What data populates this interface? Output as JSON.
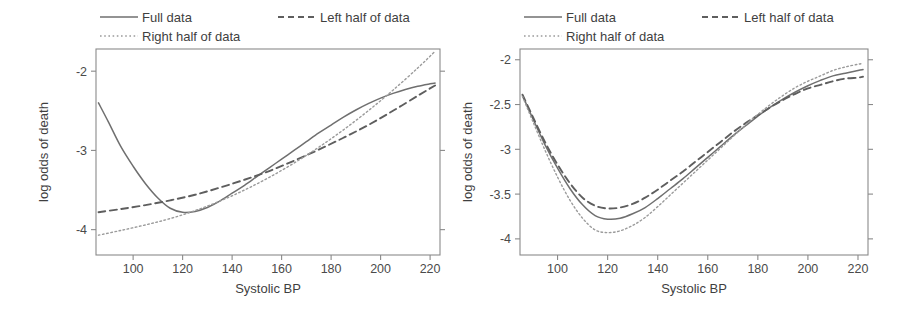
{
  "figure": {
    "title": "",
    "panel_count": 2
  },
  "legend": {
    "position": "top",
    "entries": [
      {
        "label": "Full data",
        "style": "solid",
        "color": "#6f6f6f"
      },
      {
        "label": "Left half of data",
        "style": "dashed",
        "color": "#5e5e5e"
      },
      {
        "label": "Right half of data",
        "style": "dotted",
        "color": "#9b9b9b"
      }
    ]
  },
  "chart_data": [
    {
      "type": "line",
      "panel": "left",
      "title": "",
      "xlabel": "Systolic BP",
      "ylabel": "log odds of death",
      "xlim": [
        85,
        224
      ],
      "ylim": [
        -4.32,
        -1.72
      ],
      "xticks": [
        100,
        120,
        140,
        160,
        180,
        200,
        220
      ],
      "xtick_labels": [
        "100",
        "120",
        "140",
        "160",
        "180",
        "200",
        "220"
      ],
      "yticks": [
        -2,
        -3,
        -4
      ],
      "ytick_labels": [
        "-2",
        "-3",
        "-4"
      ],
      "grid": false,
      "series": [
        {
          "name": "Full data",
          "style": "solid",
          "color": "#6f6f6f",
          "x": [
            86,
            90,
            95,
            100,
            105,
            110,
            115,
            120,
            125,
            130,
            135,
            140,
            145,
            150,
            155,
            160,
            165,
            170,
            175,
            180,
            185,
            190,
            195,
            200,
            205,
            210,
            215,
            220,
            222
          ],
          "y": [
            -2.4,
            -2.64,
            -2.95,
            -3.2,
            -3.42,
            -3.6,
            -3.73,
            -3.78,
            -3.77,
            -3.72,
            -3.64,
            -3.54,
            -3.44,
            -3.33,
            -3.22,
            -3.11,
            -3.0,
            -2.89,
            -2.78,
            -2.68,
            -2.58,
            -2.49,
            -2.41,
            -2.34,
            -2.28,
            -2.23,
            -2.19,
            -2.16,
            -2.15
          ]
        },
        {
          "name": "Left half of data",
          "style": "dashed",
          "color": "#5e5e5e",
          "x": [
            86,
            95,
            105,
            115,
            125,
            135,
            145,
            155,
            165,
            175,
            185,
            195,
            205,
            215,
            222
          ],
          "y": [
            -3.78,
            -3.74,
            -3.69,
            -3.63,
            -3.56,
            -3.47,
            -3.37,
            -3.26,
            -3.13,
            -2.99,
            -2.84,
            -2.68,
            -2.5,
            -2.31,
            -2.18
          ]
        },
        {
          "name": "Right half of data",
          "style": "dotted",
          "color": "#9b9b9b",
          "x": [
            86,
            95,
            105,
            115,
            125,
            135,
            145,
            155,
            165,
            175,
            185,
            195,
            205,
            215,
            222
          ],
          "y": [
            -4.07,
            -4.01,
            -3.94,
            -3.86,
            -3.76,
            -3.64,
            -3.5,
            -3.34,
            -3.16,
            -2.96,
            -2.74,
            -2.5,
            -2.24,
            -1.96,
            -1.75
          ]
        }
      ]
    },
    {
      "type": "line",
      "panel": "right",
      "title": "",
      "xlabel": "Systolic BP",
      "ylabel": "log odds of death",
      "xlim": [
        85,
        224
      ],
      "ylim": [
        -4.18,
        -1.88
      ],
      "xticks": [
        100,
        120,
        140,
        160,
        180,
        200,
        220
      ],
      "xtick_labels": [
        "100",
        "120",
        "140",
        "160",
        "180",
        "200",
        "220"
      ],
      "yticks": [
        -2,
        -2.5,
        -3,
        -3.5,
        -4
      ],
      "ytick_labels": [
        "-2",
        "-2.5",
        "-3",
        "-3.5",
        "-4"
      ],
      "grid": false,
      "series": [
        {
          "name": "Full data",
          "style": "solid",
          "color": "#6f6f6f",
          "x": [
            86,
            90,
            95,
            100,
            105,
            110,
            115,
            120,
            125,
            130,
            135,
            140,
            145,
            150,
            155,
            160,
            165,
            170,
            175,
            180,
            185,
            190,
            195,
            200,
            205,
            210,
            215,
            220,
            222
          ],
          "y": [
            -2.4,
            -2.65,
            -2.95,
            -3.21,
            -3.44,
            -3.62,
            -3.74,
            -3.78,
            -3.77,
            -3.72,
            -3.65,
            -3.55,
            -3.44,
            -3.33,
            -3.21,
            -3.09,
            -2.97,
            -2.85,
            -2.74,
            -2.63,
            -2.53,
            -2.44,
            -2.36,
            -2.29,
            -2.23,
            -2.18,
            -2.15,
            -2.12,
            -2.11
          ]
        },
        {
          "name": "Left half of data",
          "style": "dashed",
          "color": "#5e5e5e",
          "x": [
            86,
            90,
            95,
            100,
            105,
            110,
            115,
            120,
            125,
            130,
            135,
            140,
            145,
            150,
            155,
            160,
            165,
            170,
            175,
            180,
            185,
            190,
            195,
            200,
            205,
            210,
            215,
            220,
            222
          ],
          "y": [
            -2.39,
            -2.63,
            -2.92,
            -3.17,
            -3.38,
            -3.54,
            -3.63,
            -3.66,
            -3.65,
            -3.61,
            -3.54,
            -3.45,
            -3.35,
            -3.25,
            -3.14,
            -3.03,
            -2.92,
            -2.81,
            -2.71,
            -2.62,
            -2.53,
            -2.45,
            -2.38,
            -2.32,
            -2.28,
            -2.24,
            -2.21,
            -2.2,
            -2.19
          ]
        },
        {
          "name": "Right half of data",
          "style": "dotted",
          "color": "#9b9b9b",
          "x": [
            86,
            90,
            95,
            100,
            105,
            110,
            115,
            120,
            125,
            130,
            135,
            140,
            145,
            150,
            155,
            160,
            165,
            170,
            175,
            180,
            185,
            190,
            195,
            200,
            205,
            210,
            215,
            220,
            222
          ],
          "y": [
            -2.41,
            -2.68,
            -3.01,
            -3.31,
            -3.57,
            -3.77,
            -3.9,
            -3.93,
            -3.91,
            -3.85,
            -3.76,
            -3.64,
            -3.51,
            -3.38,
            -3.25,
            -3.12,
            -2.99,
            -2.86,
            -2.73,
            -2.61,
            -2.5,
            -2.4,
            -2.31,
            -2.24,
            -2.18,
            -2.12,
            -2.08,
            -2.05,
            -2.04
          ]
        }
      ]
    }
  ]
}
